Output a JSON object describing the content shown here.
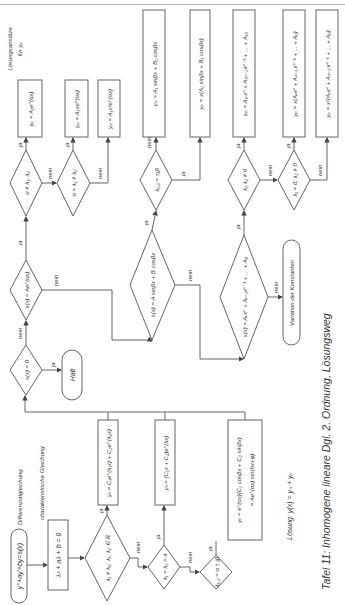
{
  "page": {
    "caption": "Tafel 11: Inhomogene lineare Dgl. 2. Ordnung, Lösungsweg",
    "solution_label": "Lösung: y(x) = yₕ + yₚ",
    "ansatz_header_line1": "Lösungsansätze",
    "ansatz_header_line2": "für yₚ"
  },
  "labels": {
    "yes": "ja",
    "no": "nein",
    "differential_equation": "Differenzialgleichung",
    "characteristic_equation": "charakteristische Gleichung"
  },
  "nodes": {
    "start": "y''+ay'+by=s(x)",
    "char_eq": "λ² + aλ + b = 0",
    "d_real_distinct": "λ₁ ≠ λ₂; λ₁, λ₂ ∈ ℝ",
    "yh_real_distinct": "yₕ = C₁e^(λ₁x) + C₂e^(λ₂x)",
    "d_double_root": "λ₁ = λ₂ = λ",
    "yh_double_root": "yₕ = (C₁x + C₂)e^(λx)",
    "d_complex": "λ₁,₂ = α ± jβ",
    "yh_complex_1": "yₕ = e^(αx)(C₁ cosβx + C₂ sinβx)",
    "yh_complex_2": "= Ae^(αx) sin(bx+φ)",
    "d_s_zero": "s(x) = 0",
    "halt": "Halt",
    "d_s_exp": "s(x) = Ae^(αx)",
    "d_alpha_ne": "α ≠ λ₁, λ₂",
    "d_alpha_eq_l1": "α = λ₁ ≠ λ₂",
    "yp_exp_1": "yₚ = A₁e^(αx)",
    "yp_exp_2": "yₚ = A₁xe^(αx)",
    "yp_exp_3": "yₚ = A₁x²e^(αx)",
    "d_s_trig": "s(x) = A sinβx + B cosβx",
    "d_lambda_jbeta": "λ₁,₂ = ±jβ",
    "yp_trig_1": "yₚ = A₁ sinβx + B₁ cosβx",
    "yp_trig_2": "yₚ = x(A₁ sinβx + B₁ cosβx)",
    "d_s_poly": "s(x) = Aₙxⁿ + Aₙ₋₁xⁿ⁻¹ + ... + A₀",
    "variation": "Variation der Konstanten",
    "d_l1l2_ne0": "λ₁·λ₂ ≠ 0",
    "d_l1_0_l2_ne0": "λ₁ = 0; λ₂ ≠ 0",
    "yp_poly_1": "yₚ = A₁ₙxⁿ + A₁₍ₙ₋₁₎xⁿ⁻¹ + ... + A₁₀",
    "yp_poly_2": "yₚ = x(Aₙxⁿ + A₍ₙ₋₁₎xⁿ⁻¹ + ... + A₀)",
    "yp_poly_3": "yₚ = x²(Aₙxⁿ + A₍ₙ₋₁₎xⁿ⁻¹ + ... + A₀)"
  }
}
